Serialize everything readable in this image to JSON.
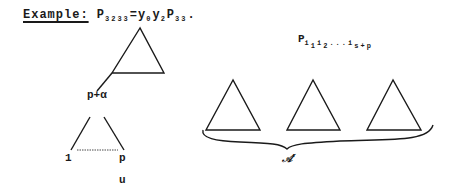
{
  "heading": {
    "example_label": "Example:",
    "formula_lhs_base": "P",
    "formula_lhs_sub": "3233",
    "formula_eq": "=",
    "formula_rhs": [
      {
        "base": "y",
        "sub": "0"
      },
      {
        "base": "y",
        "sub": "2"
      },
      {
        "base": "P",
        "sub": "33"
      }
    ],
    "formula_end": "."
  },
  "right_label": {
    "base": "P",
    "sub1": "i",
    "sub1_index": "1",
    "sub2": "i",
    "sub2_index": "2",
    "dots": "...",
    "sub3": "i",
    "sub3_index": "s+p"
  },
  "left_tree": {
    "node_label": "p+α",
    "leaf_left": "1",
    "leaf_right": "p",
    "below_label": "u"
  },
  "brace_label": "𝒜'",
  "stroke_color": "#1a1a1a"
}
